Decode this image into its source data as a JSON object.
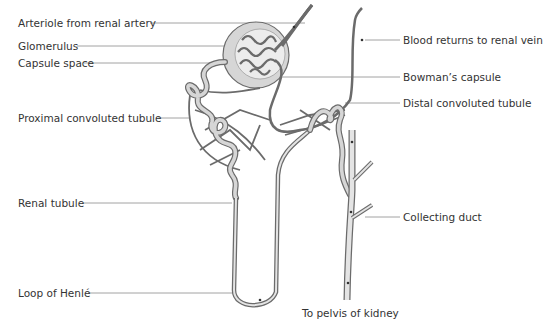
{
  "diagram": {
    "colors": {
      "vessel": "#6b6b6b",
      "tubule_fill": "#d6d6d6",
      "tubule_stroke": "#6b6b6b",
      "leader": "#8a8a8a",
      "text": "#333333"
    },
    "labels": {
      "arteriole": "Arteriole from renal artery",
      "glomerulus": "Glomerulus",
      "capsule_space": "Capsule space",
      "proximal": "Proximal convoluted tubule",
      "renal_tubule": "Renal tubule",
      "loop_henle": "Loop of Henlé",
      "blood_returns": "Blood returns to renal vein",
      "bowmans": "Bowman’s capsule",
      "distal": "Distal convoluted tubule",
      "collecting_duct": "Collecting duct",
      "pelvis": "To pelvis of kidney"
    }
  }
}
